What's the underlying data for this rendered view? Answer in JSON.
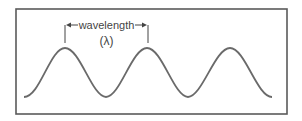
{
  "diagram": {
    "label": "wavelength",
    "symbol": "(λ)",
    "colors": {
      "border": "#5a5a5a",
      "wave": "#6a6a6a",
      "text": "#444444",
      "background": "#ffffff"
    },
    "wave": {
      "peaks": 3,
      "peak_x": [
        65,
        147,
        230
      ],
      "peak_y": 48,
      "trough_y": 97
    }
  }
}
